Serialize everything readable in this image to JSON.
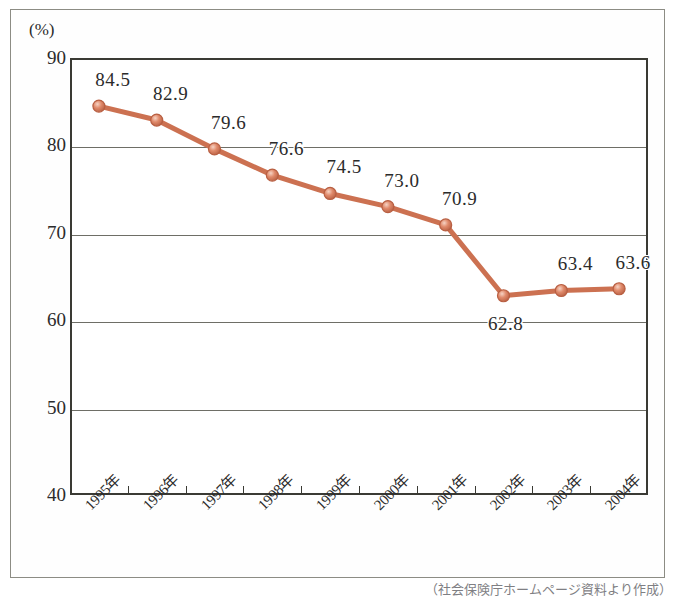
{
  "figure": {
    "axis_unit": "(%)",
    "source_note": "（社会保険庁ホームページ資料より作成）"
  },
  "colors": {
    "line": "#cc7151",
    "marker_fill": "#e08a6b",
    "marker_edge": "#b85f42",
    "frame": "#3a3a34",
    "gridline": "#6e6e66",
    "text": "#2b2b2b"
  },
  "chart_data": {
    "type": "line",
    "title": "",
    "xlabel": "",
    "ylabel": "(%)",
    "ylim": [
      40,
      90
    ],
    "ytick_labels": [
      "90",
      "80",
      "70",
      "60",
      "50",
      "40"
    ],
    "yticks": [
      90,
      80,
      70,
      60,
      50,
      40
    ],
    "grid": true,
    "legend": "none",
    "categories": [
      "1995年",
      "1996年",
      "1997年",
      "1998年",
      "1999年",
      "2000年",
      "2001年",
      "2002年",
      "2003年",
      "2004年"
    ],
    "values": [
      84.5,
      82.9,
      79.6,
      76.6,
      74.5,
      73.0,
      70.9,
      62.8,
      63.4,
      63.6
    ],
    "data_labels": [
      "84.5",
      "82.9",
      "79.6",
      "76.6",
      "74.5",
      "73.0",
      "70.9",
      "62.8",
      "63.4",
      "63.6"
    ],
    "label_placement": [
      "above",
      "above",
      "above",
      "above",
      "above",
      "above",
      "above",
      "below",
      "above",
      "above"
    ]
  }
}
